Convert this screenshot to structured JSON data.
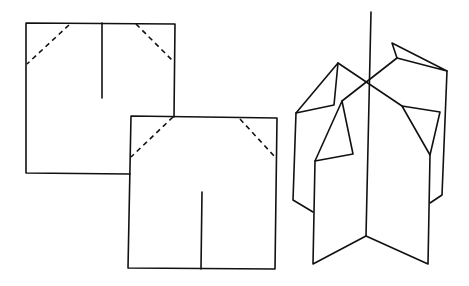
{
  "diagram": {
    "colors": {
      "line": "#111111",
      "background": "#ffffff"
    },
    "square_1": {
      "outline": [
        [
          26,
          23
        ],
        [
          175,
          24
        ],
        [
          174,
          174
        ],
        [
          26,
          173
        ]
      ],
      "cut_line": [
        [
          102,
          23
        ],
        [
          102,
          98
        ]
      ],
      "fold_lines_dashed": [
        [
          [
            69,
            25
          ],
          [
            27,
            64
          ]
        ],
        [
          [
            136,
            24
          ],
          [
            174,
            62
          ]
        ]
      ]
    },
    "square_2": {
      "outline": [
        [
          131,
          116
        ],
        [
          277,
          118
        ],
        [
          275,
          269
        ],
        [
          128,
          268
        ]
      ],
      "cut_line": [
        [
          202,
          192
        ],
        [
          201,
          269
        ]
      ],
      "fold_lines_dashed": [
        [
          [
            173,
            117
          ],
          [
            131,
            157
          ]
        ],
        [
          [
            240,
            119
          ],
          [
            275,
            157
          ]
        ]
      ]
    },
    "assembly_3d": {
      "pole": [
        [
          371,
          12
        ],
        [
          366,
          236
        ]
      ],
      "front_left_panel": [
        [
          313,
          162
        ],
        [
          313,
          264
        ],
        [
          366,
          236
        ]
      ],
      "front_right_panel": [
        [
          366,
          236
        ],
        [
          428,
          264
        ],
        [
          430,
          155
        ]
      ],
      "back_left_panel": [
        [
          296,
          113
        ],
        [
          293,
          200
        ],
        [
          313,
          212
        ]
      ],
      "back_right_panel": [
        [
          447,
          71
        ],
        [
          442,
          195
        ],
        [
          430,
          203
        ]
      ],
      "left_top_fold": [
        [
          296,
          113
        ],
        [
          338,
          63
        ],
        [
          334,
          105
        ],
        [
          296,
          113
        ]
      ],
      "left_diagonal": [
        [
          338,
          63
        ],
        [
          402,
          106
        ]
      ],
      "right_diagonal": [
        [
          342,
          101
        ],
        [
          397,
          58
        ]
      ],
      "left_triangle": [
        [
          342,
          101
        ],
        [
          353,
          154
        ],
        [
          315,
          161
        ]
      ],
      "right_top_fold": [
        [
          397,
          58
        ],
        [
          392,
          43
        ],
        [
          447,
          71
        ],
        [
          397,
          58
        ]
      ],
      "right_triangle": [
        [
          402,
          106
        ],
        [
          440,
          112
        ],
        [
          430,
          155
        ]
      ]
    }
  }
}
